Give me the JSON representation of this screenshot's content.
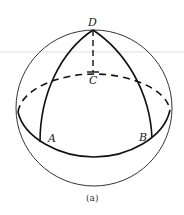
{
  "figure": {
    "caption": "(a)",
    "labels": {
      "D": "D",
      "C": "C",
      "A": "A",
      "B": "B"
    },
    "colors": {
      "stroke": "#111111",
      "thin_stroke": "#333333",
      "guide_line": "#dddddd",
      "background": "#ffffff"
    }
  }
}
